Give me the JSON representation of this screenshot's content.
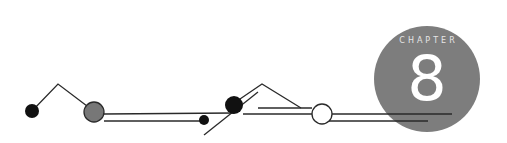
{
  "chapter": {
    "label": "CHAPTER",
    "number": "8"
  },
  "colors": {
    "badge": "#7d7d7d",
    "line": "#2a2a2a",
    "gray_node": "#777777",
    "black_node": "#111111",
    "white_node": "#ffffff"
  },
  "decoration": {
    "nodes": [
      {
        "name": "black-dot-left",
        "cx": 32,
        "cy": 111,
        "r": 7,
        "fill": "black"
      },
      {
        "name": "gray-circle",
        "cx": 94,
        "cy": 112,
        "r": 10,
        "fill": "gray"
      },
      {
        "name": "small-black-dot",
        "cx": 204,
        "cy": 120,
        "r": 5,
        "fill": "black"
      },
      {
        "name": "big-black-dot",
        "cx": 234,
        "cy": 105,
        "r": 9,
        "fill": "black"
      },
      {
        "name": "white-circle",
        "cx": 322,
        "cy": 114,
        "r": 10,
        "fill": "white"
      }
    ]
  }
}
